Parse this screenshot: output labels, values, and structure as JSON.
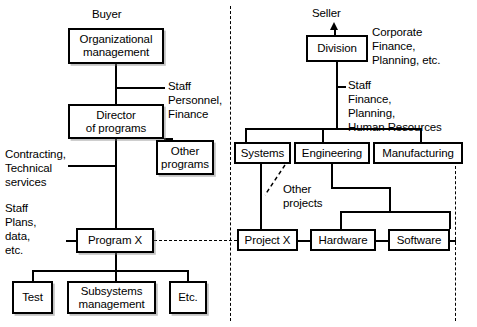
{
  "diagram": {
    "side_labels": {
      "buyer": "Buyer",
      "seller": "Seller"
    },
    "buyer": {
      "boxes": {
        "organizational_management": "Organizational\nmanagement",
        "director_of_programs": "Director\nof programs",
        "other_programs": "Other\nprograms",
        "program_x": "Program X",
        "test": "Test",
        "subsystems_management": "Subsystems\nmanagement",
        "etc": "Etc."
      },
      "annotations": {
        "staff_personnel_finance": "Staff\nPersonnel,\nFinance",
        "contracting_technical_services": "Contracting,\nTechnical\nservices",
        "staff_plans_data_etc": "Staff\n   Plans,\n   data,\n   etc."
      }
    },
    "seller": {
      "boxes": {
        "division": "Division",
        "systems": "Systems",
        "engineering": "Engineering",
        "manufacturing": "Manufacturing",
        "project_x": "Project X",
        "hardware": "Hardware",
        "software": "Software"
      },
      "annotations": {
        "corporate_finance_planning": "Corporate\n   Finance,\n   Planning, etc.",
        "staff_finance_planning_hr": "Staff\n   Finance,\n   Planning,\n   Human Resources",
        "other_projects": "Other\nprojects"
      }
    },
    "colors": {
      "line": "#000000",
      "background": "#ffffff",
      "text": "#000000"
    }
  }
}
